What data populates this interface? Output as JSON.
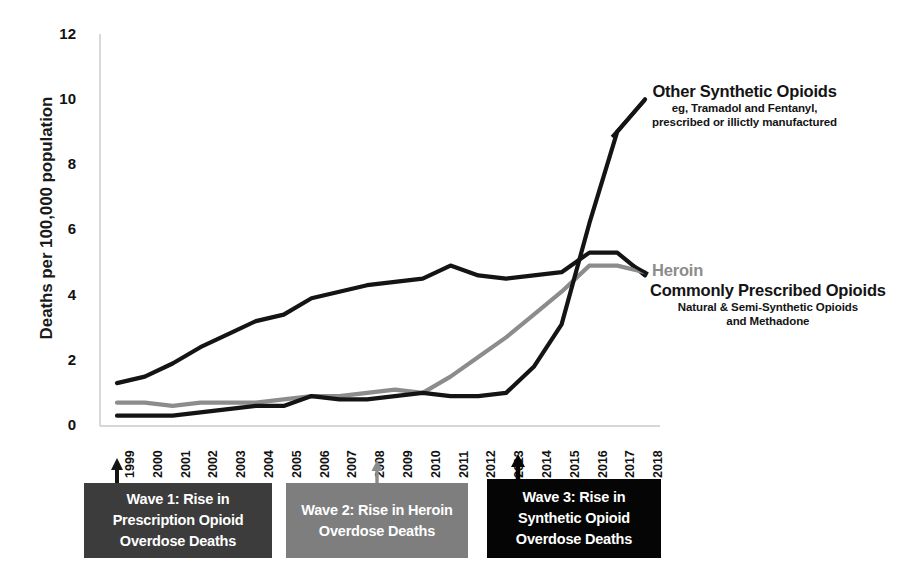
{
  "chart_data": {
    "type": "line",
    "title": "",
    "xlabel": "",
    "ylabel": "Deaths per 100,000 population",
    "xlim": [
      1999,
      2018
    ],
    "ylim": [
      0,
      12
    ],
    "yticks": [
      0,
      2,
      4,
      6,
      8,
      10,
      12
    ],
    "grid": false,
    "legend_position": "inline-right-annotations",
    "categories": [
      "1999",
      "2000",
      "2001",
      "2002",
      "2003",
      "2004",
      "2005",
      "2006",
      "2007",
      "2008",
      "2009",
      "2010",
      "2011",
      "2012",
      "2013",
      "2014",
      "2015",
      "2016",
      "2017",
      "2018"
    ],
    "series": [
      {
        "name": "Commonly Prescribed Opioids",
        "sublabel": "Natural & Semi-Synthetic Opioids and Methadone",
        "color": "#141414",
        "values": [
          1.3,
          1.5,
          1.9,
          2.4,
          2.8,
          3.2,
          3.4,
          3.9,
          4.1,
          4.3,
          4.4,
          4.5,
          4.9,
          4.6,
          4.5,
          4.6,
          4.7,
          5.3,
          5.3,
          4.6
        ]
      },
      {
        "name": "Heroin",
        "sublabel": "",
        "color": "#8c8c8c",
        "values": [
          0.7,
          0.7,
          0.6,
          0.7,
          0.7,
          0.7,
          0.8,
          0.9,
          0.9,
          1.0,
          1.1,
          1.0,
          1.5,
          2.1,
          2.7,
          3.4,
          4.1,
          4.9,
          4.9,
          4.7
        ]
      },
      {
        "name": "Other Synthetic Opioids",
        "sublabel": "eg, Tramadol and Fentanyl, prescribed or illictly manufactured",
        "color": "#141414",
        "values": [
          0.3,
          0.3,
          0.3,
          0.4,
          0.5,
          0.6,
          0.6,
          0.9,
          0.8,
          0.8,
          0.9,
          1.0,
          0.9,
          0.9,
          1.0,
          1.8,
          3.1,
          6.2,
          9.0,
          10.0
        ]
      }
    ],
    "annotations": [
      {
        "id": "synthetic",
        "main": "Other Synthetic Opioids",
        "sub_line1": "eg, Tramadol and Fentanyl,",
        "sub_line2": "prescribed or illictly manufactured",
        "color": "#141414"
      },
      {
        "id": "heroin",
        "main": "Heroin",
        "sub_line1": "",
        "sub_line2": "",
        "color": "#8c8c8c"
      },
      {
        "id": "prescribed",
        "main": "Commonly Prescribed Opioids",
        "sub_line1": "Natural & Semi-Synthetic Opioids",
        "sub_line2": "and Methadone",
        "color": "#141414"
      }
    ],
    "waves": [
      {
        "id": "wave1",
        "line1": "Wave 1: Rise in",
        "line2": "Prescription Opioid",
        "line3": "Overdose Deaths",
        "box_color": "#3c3c3c",
        "arrow_color": "#141414",
        "marker_year": "1999"
      },
      {
        "id": "wave2",
        "line1": "Wave 2: Rise in Heroin",
        "line2": "Overdose Deaths",
        "line3": "",
        "box_color": "#7e7e7e",
        "arrow_color": "#8c8c8c",
        "marker_year": "2010"
      },
      {
        "id": "wave3",
        "line1": "Wave 3: Rise in",
        "line2": "Synthetic Opioid",
        "line3": "Overdose Deaths",
        "box_color": "#050505",
        "arrow_color": "#050505",
        "marker_year": "2013"
      }
    ]
  },
  "axis": {
    "y_title": "Deaths per 100,000 population",
    "y_ticks": [
      "12",
      "10",
      "8",
      "6",
      "4",
      "2",
      "0"
    ],
    "x_ticks": [
      "1999",
      "2000",
      "2001",
      "2002",
      "2003",
      "2004",
      "2005",
      "2006",
      "2007",
      "2008",
      "2009",
      "2010",
      "2011",
      "2012",
      "2013",
      "2014",
      "2015",
      "2016",
      "2017",
      "2018"
    ]
  }
}
